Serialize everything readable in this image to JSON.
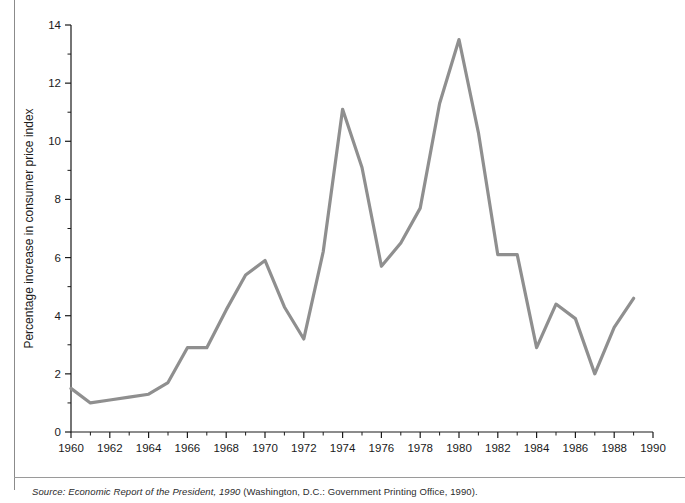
{
  "figure": {
    "source_prefix": "Source:",
    "source_italic": "Economic Report of the President, 1990",
    "source_plain": "(Washington, D.C.: Government Printing Office, 1990)."
  },
  "chart_data": {
    "type": "line",
    "title": "",
    "xlabel": "Year",
    "ylabel": "Percentage increase in consumer price index",
    "xlim": [
      1960,
      1990
    ],
    "ylim": [
      0,
      14
    ],
    "grid": false,
    "legend": null,
    "x_major_ticks": [
      1960,
      1962,
      1964,
      1966,
      1968,
      1970,
      1972,
      1974,
      1976,
      1978,
      1980,
      1982,
      1984,
      1986,
      1988,
      1990
    ],
    "x_minor_ticks": [
      1961,
      1963,
      1965,
      1967,
      1969,
      1971,
      1973,
      1975,
      1977,
      1979,
      1981,
      1983,
      1985,
      1987,
      1989
    ],
    "y_major_ticks": [
      0,
      2,
      4,
      6,
      8,
      10,
      12,
      14
    ],
    "y_minor_ticks": [
      1,
      3,
      5,
      7,
      9,
      11,
      13
    ],
    "x_tick_labels": [
      "1960",
      "1962",
      "1964",
      "1966",
      "1968",
      "1970",
      "1972",
      "1974",
      "1976",
      "1978",
      "1980",
      "1982",
      "1984",
      "1986",
      "1988",
      "1990"
    ],
    "y_tick_labels": [
      "0",
      "2",
      "4",
      "6",
      "8",
      "10",
      "12",
      "14"
    ],
    "line_color": "#8f8f8f",
    "x": [
      1960,
      1961,
      1962,
      1963,
      1964,
      1965,
      1966,
      1967,
      1968,
      1969,
      1970,
      1971,
      1972,
      1973,
      1974,
      1975,
      1976,
      1977,
      1978,
      1979,
      1980,
      1981,
      1982,
      1983,
      1984,
      1985,
      1986,
      1987,
      1988,
      1989
    ],
    "values": [
      1.5,
      1.0,
      1.1,
      1.2,
      1.3,
      1.7,
      2.9,
      2.9,
      4.2,
      5.4,
      5.9,
      4.3,
      3.2,
      6.2,
      11.1,
      9.1,
      5.7,
      6.5,
      7.7,
      11.3,
      13.5,
      10.3,
      6.1,
      6.1,
      2.9,
      4.4,
      3.9,
      2.0,
      3.6,
      4.6
    ]
  }
}
